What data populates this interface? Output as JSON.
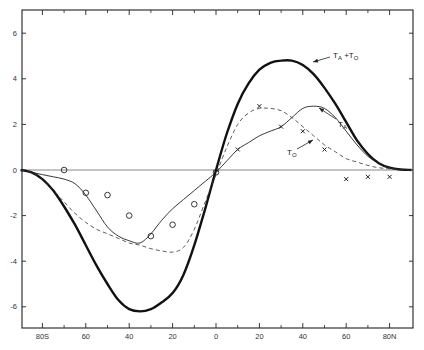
{
  "chart_data": {
    "type": "line",
    "title": "",
    "xlabel": "",
    "ylabel": "",
    "xlim": [
      -90,
      90
    ],
    "ylim": [
      -7,
      7
    ],
    "grid": false,
    "legend": "inline annotations with arrows",
    "x_ticks": [
      -80,
      -60,
      -40,
      -20,
      0,
      20,
      40,
      60,
      80
    ],
    "x_tick_labels": [
      "80S",
      "60",
      "40",
      "20",
      "0",
      "20",
      "40",
      "60",
      "80N"
    ],
    "x_minor_ticks": [
      -70,
      -50,
      -30,
      -10,
      10,
      30,
      50,
      70
    ],
    "y_ticks": [
      6,
      4,
      2,
      0,
      -2,
      -4,
      -6
    ],
    "y_tick_labels": [
      "6",
      "4",
      "2",
      "0",
      "-2",
      "-4",
      "-6"
    ],
    "zero_line": true,
    "series": [
      {
        "name": "T_A + T_O",
        "label_main": "T",
        "label_parts": [
          "A",
          "+T",
          "O"
        ],
        "style": "thick-solid",
        "x": [
          -90,
          -85,
          -80,
          -75,
          -70,
          -65,
          -60,
          -55,
          -50,
          -45,
          -40,
          -35,
          -30,
          -25,
          -20,
          -15,
          -10,
          -5,
          0,
          5,
          10,
          15,
          20,
          25,
          30,
          35,
          40,
          45,
          50,
          55,
          60,
          65,
          70,
          75,
          80,
          85,
          90
        ],
        "values": [
          0,
          -0.1,
          -0.4,
          -0.9,
          -1.6,
          -2.4,
          -3.3,
          -4.2,
          -5.0,
          -5.7,
          -6.1,
          -6.2,
          -6.1,
          -5.8,
          -5.4,
          -4.6,
          -3.3,
          -1.7,
          0,
          1.6,
          2.9,
          3.8,
          4.4,
          4.7,
          4.8,
          4.8,
          4.6,
          4.2,
          3.6,
          2.9,
          2.1,
          1.3,
          0.7,
          0.3,
          0.1,
          0.02,
          0
        ]
      },
      {
        "name": "T_A",
        "label_main": "T",
        "label_parts": [
          "A"
        ],
        "style": "thin-solid",
        "x": [
          -90,
          -85,
          -80,
          -75,
          -70,
          -65,
          -60,
          -55,
          -50,
          -45,
          -40,
          -35,
          -30,
          -25,
          -20,
          -15,
          -10,
          -5,
          0,
          5,
          10,
          15,
          20,
          25,
          30,
          35,
          40,
          45,
          50,
          55,
          60,
          65,
          70,
          75,
          80,
          85,
          90
        ],
        "values": [
          0,
          -0.1,
          -0.2,
          -0.3,
          -0.4,
          -0.6,
          -1.1,
          -1.8,
          -2.5,
          -2.9,
          -3.1,
          -3.2,
          -2.8,
          -2.2,
          -1.7,
          -1.3,
          -0.9,
          -0.5,
          -0.1,
          0.4,
          0.9,
          1.2,
          1.5,
          1.7,
          1.9,
          2.3,
          2.7,
          2.8,
          2.7,
          2.3,
          1.7,
          1.1,
          0.6,
          0.3,
          0.1,
          0.02,
          0
        ]
      },
      {
        "name": "T_O",
        "label_main": "T",
        "label_parts": [
          "O"
        ],
        "style": "dashed",
        "x": [
          -90,
          -85,
          -80,
          -75,
          -70,
          -65,
          -60,
          -55,
          -50,
          -45,
          -40,
          -35,
          -30,
          -25,
          -20,
          -15,
          -10,
          -5,
          0,
          5,
          10,
          15,
          20,
          25,
          30,
          35,
          40,
          45,
          50,
          55,
          60,
          65,
          70,
          75,
          80,
          85,
          90
        ],
        "values": [
          0,
          -0.1,
          -0.4,
          -0.9,
          -1.4,
          -1.9,
          -2.3,
          -2.6,
          -2.8,
          -3.0,
          -3.2,
          -3.3,
          -3.45,
          -3.55,
          -3.6,
          -3.4,
          -2.6,
          -1.4,
          -0.2,
          1.0,
          2.0,
          2.5,
          2.7,
          2.7,
          2.6,
          2.3,
          1.9,
          1.5,
          1.1,
          0.8,
          0.5,
          0.35,
          0.2,
          0.1,
          0.05,
          0.01,
          0
        ]
      },
      {
        "name": "observed (circles)",
        "style": "circle-markers",
        "x": [
          -70,
          -60,
          -50,
          -40,
          -30,
          -20,
          -10,
          0
        ],
        "values": [
          0.0,
          -1.0,
          -1.1,
          -2.0,
          -2.9,
          -2.4,
          -1.5,
          -0.1
        ]
      },
      {
        "name": "observed (crosses)",
        "style": "x-markers",
        "x": [
          10,
          20,
          30,
          40,
          50,
          60,
          70,
          80
        ],
        "values": [
          0.9,
          2.8,
          1.9,
          1.7,
          0.9,
          -0.4,
          -0.3,
          -0.3
        ]
      }
    ],
    "annotations": [
      {
        "text": "T_A +T_O",
        "points_to": {
          "x": 43,
          "y": 4.6
        }
      },
      {
        "text": "T_A",
        "points_to": {
          "x": 45,
          "y": 2.7
        }
      },
      {
        "text": "T_O",
        "points_to": {
          "x": 35,
          "y": 1.3
        }
      }
    ]
  }
}
